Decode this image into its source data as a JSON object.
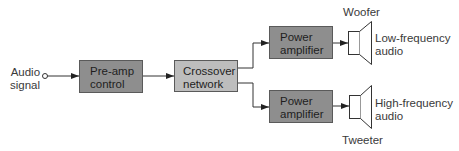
{
  "diagram": {
    "type": "block-diagram",
    "input": {
      "label": "Audio\nsignal"
    },
    "blocks": [
      {
        "id": "preamp",
        "label": "Pre-amp\ncontrol",
        "fill": "#8e8e8e"
      },
      {
        "id": "crossover",
        "label": "Crossover\nnetwork",
        "fill": "#bdbdbd"
      },
      {
        "id": "amp_low",
        "label": "Power\namplifier",
        "fill": "#8e8e8e"
      },
      {
        "id": "amp_high",
        "label": "Power\namplifier",
        "fill": "#8e8e8e"
      }
    ],
    "speakers": [
      {
        "id": "woofer",
        "name": "Woofer",
        "output_label": "Low-frequency\naudio"
      },
      {
        "id": "tweeter",
        "name": "Tweeter",
        "output_label": "High-frequency\naudio"
      }
    ],
    "connections": [
      {
        "from": "input",
        "to": "preamp"
      },
      {
        "from": "preamp",
        "to": "crossover"
      },
      {
        "from": "crossover",
        "to": "amp_low"
      },
      {
        "from": "crossover",
        "to": "amp_high"
      },
      {
        "from": "amp_low",
        "to": "woofer"
      },
      {
        "from": "amp_high",
        "to": "tweeter"
      }
    ],
    "colors": {
      "line": "#333333",
      "text": "#3a3a3a",
      "dark_block": "#8e8e8e",
      "light_block": "#bdbdbd"
    }
  }
}
